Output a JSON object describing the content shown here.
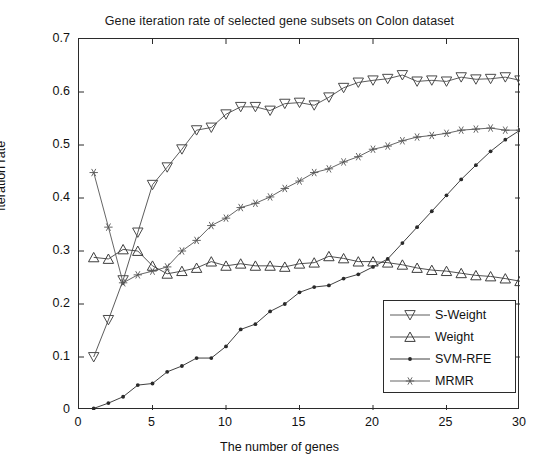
{
  "chart_data": {
    "type": "line",
    "title": "Gene iteration rate of selected gene subsets on Colon dataset",
    "xlabel": "The number of genes",
    "ylabel": "Iteration rate",
    "xlim": [
      0,
      30
    ],
    "ylim": [
      0,
      0.7
    ],
    "xticks": [
      "0",
      "5",
      "10",
      "15",
      "20",
      "25",
      "30"
    ],
    "xtick_values": [
      0,
      5,
      10,
      15,
      20,
      25,
      30
    ],
    "yticks": [
      "0",
      "0.1",
      "0.2",
      "0.3",
      "0.4",
      "0.5",
      "0.6",
      "0.7"
    ],
    "ytick_values": [
      0,
      0.1,
      0.2,
      0.3,
      0.4,
      0.5,
      0.6,
      0.7
    ],
    "grid": false,
    "legend_position": "lower right",
    "x": [
      1,
      2,
      3,
      4,
      5,
      6,
      7,
      8,
      9,
      10,
      11,
      12,
      13,
      14,
      15,
      16,
      17,
      18,
      19,
      20,
      21,
      22,
      23,
      24,
      25,
      26,
      27,
      28,
      29,
      30
    ],
    "series": [
      {
        "name": "S-Weight",
        "marker": "triangle-down",
        "color": "#4a4a4a",
        "values": [
          0.1,
          0.17,
          0.245,
          0.335,
          0.425,
          0.458,
          0.492,
          0.528,
          0.533,
          0.558,
          0.572,
          0.572,
          0.565,
          0.578,
          0.58,
          0.575,
          0.59,
          0.608,
          0.618,
          0.622,
          0.625,
          0.632,
          0.62,
          0.622,
          0.62,
          0.628,
          0.624,
          0.625,
          0.628,
          0.622
        ]
      },
      {
        "name": "Weight",
        "marker": "triangle-up",
        "color": "#3d3d3d",
        "values": [
          0.288,
          0.285,
          0.303,
          0.3,
          0.272,
          0.257,
          0.262,
          0.268,
          0.28,
          0.272,
          0.276,
          0.272,
          0.272,
          0.27,
          0.276,
          0.278,
          0.29,
          0.286,
          0.28,
          0.28,
          0.278,
          0.274,
          0.268,
          0.264,
          0.262,
          0.258,
          0.254,
          0.252,
          0.248,
          0.243
        ]
      },
      {
        "name": "SVM-RFE",
        "marker": "dot",
        "color": "#2a2a2a",
        "values": [
          0.003,
          0.013,
          0.025,
          0.047,
          0.05,
          0.072,
          0.083,
          0.098,
          0.098,
          0.12,
          0.152,
          0.162,
          0.186,
          0.2,
          0.222,
          0.232,
          0.235,
          0.248,
          0.256,
          0.27,
          0.285,
          0.315,
          0.345,
          0.375,
          0.405,
          0.435,
          0.462,
          0.488,
          0.51,
          0.528
        ]
      },
      {
        "name": "MRMR",
        "marker": "asterisk",
        "color": "#555555",
        "values": [
          0.448,
          0.345,
          0.24,
          0.255,
          0.262,
          0.27,
          0.3,
          0.32,
          0.348,
          0.362,
          0.382,
          0.39,
          0.402,
          0.418,
          0.432,
          0.448,
          0.455,
          0.468,
          0.478,
          0.492,
          0.498,
          0.508,
          0.515,
          0.518,
          0.522,
          0.528,
          0.53,
          0.532,
          0.528,
          0.528
        ]
      }
    ]
  },
  "legend": {
    "items": [
      {
        "label": "S-Weight"
      },
      {
        "label": "Weight"
      },
      {
        "label": "SVM-RFE"
      },
      {
        "label": "MRMR"
      }
    ]
  }
}
